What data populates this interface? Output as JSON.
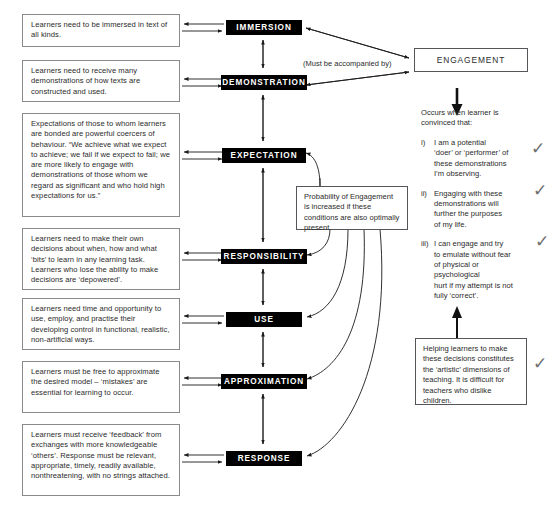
{
  "diagram": {
    "title_concept": "Conditions of Learning / Engagement model",
    "conditions": [
      {
        "id": "immersion",
        "text": "Learners need to be immersed\nin text of all kinds."
      },
      {
        "id": "demonstration",
        "text": "Learners need to receive many\ndemonstrations of how texts\nare constructed and used."
      },
      {
        "id": "expectation",
        "text": "Expectations of those to whom\nlearners are bonded are powerful\ncoercers of behaviour.\n“We achieve what we expect to\nachieve; we fail if we expect to fail;\nwe are more likely to engage with\ndemonstrations of those whom we\nregard as significant and who hold\nhigh expectations for us.”"
      },
      {
        "id": "responsibility",
        "text": "Learners need to make their own\ndecisions about when, how and what\n‘bits’ to learn in any learning task.\nLearners who lose the ability to\nmake decisions are ‘depowered’."
      },
      {
        "id": "use",
        "text": "Learners need time and opportunity\nto use, employ, and practise their\ndeveloping control in functional,\nrealistic, non-artificial ways."
      },
      {
        "id": "approximation",
        "text": "Learners must be free to approximate\nthe desired model – ‘mistakes’\nare essential for learning to\noccur."
      },
      {
        "id": "response",
        "text": "Learners must receive ‘feedback’ from\nexchanges with more knowledgeable\n‘others’.  Response must be relevant,\nappropriate, timely, readily available,\nnonthreatening, with no strings\nattached."
      }
    ],
    "processes": [
      {
        "id": "immersion",
        "label": "IMMERSION"
      },
      {
        "id": "demonstration",
        "label": "DEMONSTRATION"
      },
      {
        "id": "expectation",
        "label": "EXPECTATION"
      },
      {
        "id": "responsibility",
        "label": "RESPONSIBILITY"
      },
      {
        "id": "use",
        "label": "USE"
      },
      {
        "id": "approximation",
        "label": "APPROXIMATION"
      },
      {
        "id": "response",
        "label": "RESPONSE"
      }
    ],
    "accompanied_label": "(Must be accompanied by)",
    "engagement": {
      "label": "ENGAGEMENT",
      "intro": "Occurs when learner is\nconvinced that:",
      "items": [
        {
          "num": "i)",
          "text": "I am a potential\n‘doer’ or ‘performer’ of\nthese demonstrations\nI’m observing."
        },
        {
          "num": "ii)",
          "text": "Engaging with these\ndemonstrations will\nfurther the purposes\nof my life."
        },
        {
          "num": "iii)",
          "text": "I can engage and try\nto emulate without fear\nof physical or\npsychological\nhurt if my attempt is not\nfully ‘correct’."
        }
      ],
      "check_mark": "✓"
    },
    "probability_note": "Probability of Engagement\nis increased if these\nconditions are also\noptimally present.",
    "teaching_note": "Helping learners to make\nthese decisions constitutes\nthe ‘artistic’ dimensions\nof teaching. It is difficult\nfor teachers who dislike\nchildren.",
    "colors": {
      "process_fill": "#000000",
      "process_text": "#ffffff",
      "box_border": "#8a8a8a",
      "line": "#2b2b2b",
      "page_background": "#ffffff"
    }
  }
}
